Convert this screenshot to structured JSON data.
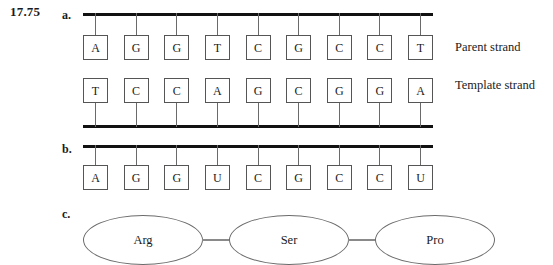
{
  "figure": {
    "exercise_number": "17.75",
    "parts": {
      "a": "a.",
      "b": "b.",
      "c": "c."
    }
  },
  "part_a": {
    "parent_strand": {
      "caption": "Parent strand",
      "bases": [
        "A",
        "G",
        "G",
        "T",
        "C",
        "G",
        "C",
        "C",
        "T"
      ]
    },
    "template_strand": {
      "caption": "Template strand",
      "bases": [
        "T",
        "C",
        "C",
        "A",
        "G",
        "C",
        "G",
        "G",
        "A"
      ]
    }
  },
  "part_b": {
    "mrna_strand": {
      "bases": [
        "A",
        "G",
        "G",
        "U",
        "C",
        "G",
        "C",
        "C",
        "U"
      ]
    }
  },
  "part_c": {
    "amino_acids": [
      "Arg",
      "Ser",
      "Pro"
    ]
  },
  "colors": {
    "backbone": "#111111",
    "box_border": "#555555",
    "ellipse_border": "#6b6b6b",
    "tick": "#6a6a6a",
    "text": "#1a1a1a",
    "background": "#ffffff"
  }
}
